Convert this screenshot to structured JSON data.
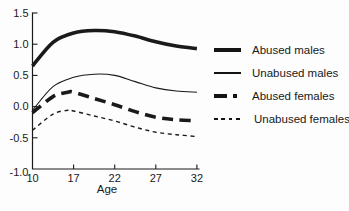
{
  "figure": {
    "background": "#ffffff",
    "ink_color": "#1a1a1a"
  },
  "chart_data": {
    "type": "line",
    "title": "",
    "xlabel": "Age",
    "ylabel": "",
    "ylim": [
      -1.0,
      1.5
    ],
    "grid": false,
    "legend_position": "right",
    "x_ticks": [
      {
        "label": "10",
        "age": 10
      },
      {
        "label": "17",
        "age": 17
      },
      {
        "label": "22",
        "age": 22
      },
      {
        "label": "27",
        "age": 27
      },
      {
        "label": "32",
        "age": 32
      }
    ],
    "x_axis_note": "tick marks evenly spaced although age gaps are 7,5,5,5",
    "y_ticks": [
      {
        "label": "1.5",
        "value": 1.5
      },
      {
        "label": "1.0",
        "value": 1.0
      },
      {
        "label": "0.5",
        "value": 0.5
      },
      {
        "label": "0.0",
        "value": 0.0
      },
      {
        "label": "-0.5",
        "value": -0.5
      },
      {
        "label": "-1.0",
        "value": -1.0
      }
    ],
    "series": [
      {
        "name": "Abused males",
        "style": "thick-solid",
        "stroke_width": 3.6,
        "dash": "none",
        "points": [
          [
            10,
            0.65
          ],
          [
            13.5,
            1.03
          ],
          [
            17,
            1.18
          ],
          [
            19.5,
            1.22
          ],
          [
            22,
            1.2
          ],
          [
            24.5,
            1.13
          ],
          [
            27,
            1.04
          ],
          [
            29.5,
            0.97
          ],
          [
            32,
            0.93
          ]
        ]
      },
      {
        "name": "Unabused males",
        "style": "thin-solid",
        "stroke_width": 1.1,
        "dash": "none",
        "points": [
          [
            10,
            -0.06
          ],
          [
            13.5,
            0.32
          ],
          [
            17,
            0.47
          ],
          [
            19.5,
            0.52
          ],
          [
            22,
            0.5
          ],
          [
            24.5,
            0.4
          ],
          [
            27,
            0.3
          ],
          [
            29.5,
            0.25
          ],
          [
            32,
            0.23
          ]
        ]
      },
      {
        "name": "Abused females",
        "style": "thick-dashed",
        "stroke_width": 3.6,
        "dash": "11 6.5",
        "points": [
          [
            10,
            -0.1
          ],
          [
            13.5,
            0.16
          ],
          [
            16,
            0.23
          ],
          [
            17,
            0.23
          ],
          [
            19.5,
            0.13
          ],
          [
            22,
            0.03
          ],
          [
            24.5,
            -0.08
          ],
          [
            27,
            -0.17
          ],
          [
            29.5,
            -0.21
          ],
          [
            32,
            -0.23
          ]
        ]
      },
      {
        "name": "Unabused females",
        "style": "thin-dashed",
        "stroke_width": 1.4,
        "dash": "4 3.6",
        "points": [
          [
            10,
            -0.38
          ],
          [
            13.5,
            -0.12
          ],
          [
            16,
            -0.06
          ],
          [
            17,
            -0.07
          ],
          [
            19.5,
            -0.15
          ],
          [
            22,
            -0.23
          ],
          [
            24.5,
            -0.33
          ],
          [
            27,
            -0.41
          ],
          [
            29.5,
            -0.45
          ],
          [
            32,
            -0.48
          ]
        ]
      }
    ]
  },
  "legend": {
    "items": [
      "Abused males",
      "Unabused males",
      "Abused females",
      "Unabused females"
    ]
  }
}
